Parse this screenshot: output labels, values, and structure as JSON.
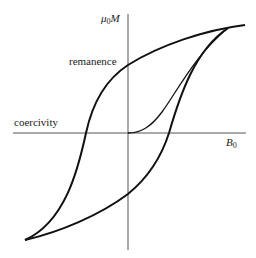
{
  "diagram": {
    "type": "hysteresis-loop",
    "axes": {
      "y_label_symbol": "μ",
      "y_label_sub": "0",
      "y_label_var": "M",
      "x_label_var": "B",
      "x_label_sub": "0"
    },
    "annotations": {
      "remanence": "remanence",
      "coercivity": "coercivity"
    },
    "colors": {
      "curve": "#111111",
      "axis": "#555555",
      "background": "#ffffff"
    }
  }
}
